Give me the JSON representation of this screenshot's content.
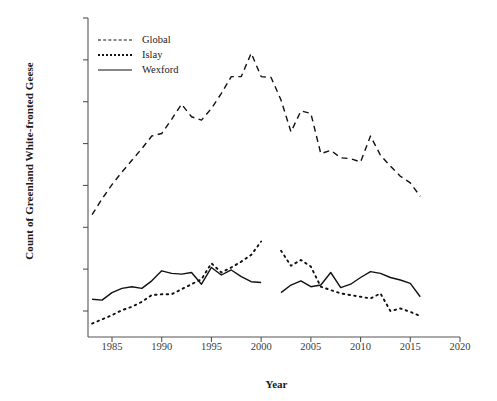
{
  "chart_data": {
    "type": "line",
    "title": "",
    "xlabel": "Year",
    "ylabel": "Count of Greenland White-fronted Geese",
    "xlim": [
      1982,
      2020
    ],
    "ylim": [
      2500,
      40000
    ],
    "xticks": [
      "1985",
      "1990",
      "1995",
      "2000",
      "2005",
      "2010",
      "2015",
      "2020"
    ],
    "xtick_values": [
      1985,
      1990,
      1995,
      2000,
      2005,
      2010,
      2015,
      2020
    ],
    "yticks": [
      "5,000",
      "10,000",
      "15,000",
      "20,000",
      "25,000",
      "30,000",
      "35,000",
      "40,000"
    ],
    "ytick_values": [
      5000,
      10000,
      15000,
      20000,
      25000,
      30000,
      35000,
      40000
    ],
    "grid": false,
    "legend_position": "top-left",
    "series": [
      {
        "name": "Global",
        "style": "dashed",
        "color": "#111111",
        "x": [
          1983,
          1984,
          1985,
          1986,
          1987,
          1988,
          1989,
          1990,
          1991,
          1992,
          1993,
          1994,
          1995,
          1996,
          1997,
          1998,
          1999,
          2000,
          2001,
          2002,
          2003,
          2004,
          2005,
          2006,
          2007,
          2008,
          2009,
          2010,
          2011,
          2012,
          2013,
          2014,
          2015,
          2016
        ],
        "values": [
          16500,
          18400,
          20100,
          21600,
          23000,
          24400,
          25900,
          26200,
          27900,
          29700,
          28200,
          27800,
          29200,
          31000,
          33000,
          33000,
          35800,
          33000,
          32900,
          30200,
          26400,
          28900,
          28600,
          23800,
          24200,
          23300,
          23200,
          22800,
          25900,
          23600,
          22300,
          21100,
          20300,
          18700
        ]
      },
      {
        "name": "Islay",
        "style": "dotted",
        "color": "#111111",
        "x": [
          1983,
          1984,
          1985,
          1986,
          1987,
          1988,
          1989,
          1990,
          1991,
          1992,
          1993,
          1994,
          1995,
          1996,
          1997,
          1998,
          1999,
          2000,
          2002,
          2003,
          2004,
          2005,
          2006,
          2007,
          2008,
          2009,
          2010,
          2011,
          2012,
          2013,
          2014,
          2015,
          2016
        ],
        "values": [
          3500,
          4000,
          4500,
          5100,
          5500,
          6100,
          6900,
          7000,
          7000,
          7600,
          8200,
          8800,
          10700,
          9600,
          10200,
          10900,
          11700,
          13300,
          12200,
          10400,
          11100,
          10300,
          7900,
          7500,
          7100,
          6900,
          6700,
          6500,
          7100,
          5000,
          5300,
          4900,
          4400
        ]
      },
      {
        "name": "Wexford",
        "style": "solid",
        "color": "#111111",
        "x": [
          1983,
          1984,
          1985,
          1986,
          1987,
          1988,
          1989,
          1990,
          1991,
          1992,
          1993,
          1994,
          1995,
          1996,
          1997,
          1998,
          1999,
          2000,
          2002,
          2003,
          2004,
          2005,
          2006,
          2007,
          2008,
          2009,
          2010,
          2011,
          2012,
          2013,
          2014,
          2015,
          2016
        ],
        "values": [
          6400,
          6300,
          7200,
          7700,
          7900,
          7700,
          8600,
          9800,
          9500,
          9400,
          9600,
          8200,
          10200,
          9300,
          9900,
          9100,
          8500,
          8400,
          7200,
          8100,
          8600,
          7900,
          8100,
          9600,
          7800,
          8200,
          9000,
          9700,
          9500,
          9000,
          8700,
          8300,
          6700
        ]
      }
    ]
  },
  "legend": {
    "items": [
      {
        "label": "Global",
        "style": "dashed"
      },
      {
        "label": "Islay",
        "style": "dotted"
      },
      {
        "label": "Wexford",
        "style": "solid"
      }
    ]
  },
  "axes": {
    "y_title": "Count of Greenland White-fronted Geese",
    "x_title": "Year"
  }
}
